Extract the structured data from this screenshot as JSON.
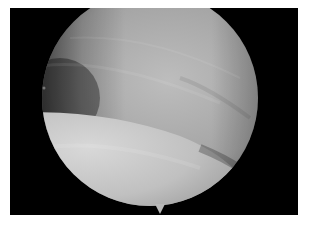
{
  "image": {
    "description": "Arthroscopic grayscale view inside a circular scope field on a black rectangular background",
    "colors": {
      "background": "#ffffff",
      "frame": "#000000",
      "upper_surface": "#9a9a9a",
      "lower_surface": "#c4c4c4"
    }
  }
}
